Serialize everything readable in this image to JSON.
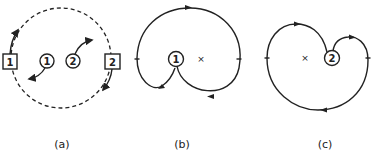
{
  "figure": {
    "panels": [
      {
        "id": "a",
        "caption": "(a)",
        "boxed_nodes": [
          "1",
          "2"
        ],
        "circled_nodes": [
          "1",
          "2"
        ]
      },
      {
        "id": "b",
        "caption": "(b)",
        "circled_node": "1",
        "center_mark": "×"
      },
      {
        "id": "c",
        "caption": "(c)",
        "circled_node": "2",
        "center_mark": "×"
      }
    ]
  }
}
